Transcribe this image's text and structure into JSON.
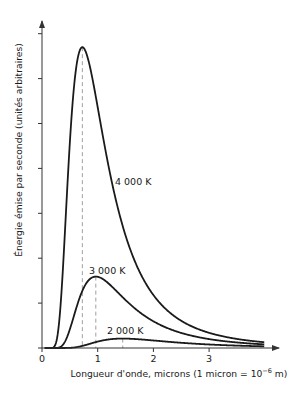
{
  "chart_data": {
    "type": "line",
    "title": "",
    "xlabel": "Longueur d'onde, microns (1 micron = 10",
    "xlabel_exp": "−6",
    "xlabel_end": " m)",
    "ylabel": "Énergie émise par seconde (unités arbitraires)",
    "xlim": [
      0,
      4.2
    ],
    "ylim": [
      0,
      7.3
    ],
    "x_ticks": [
      0,
      1,
      2,
      3
    ],
    "x_tick_labels": [
      "0",
      "1",
      "2",
      "3"
    ],
    "y_ticks": [
      1,
      2,
      3,
      4,
      5,
      6,
      7
    ],
    "y_tick_labels": [],
    "grid": false,
    "legend": "inline labels",
    "x_range_plotted": [
      0.05,
      3.99
    ],
    "series": [
      {
        "name": "4 000 K",
        "temperature_K": 4000,
        "peak_wavelength_micron": 0.72,
        "peak_value": 6.7,
        "label_pos": [
          115,
          185
        ]
      },
      {
        "name": "3 000 K",
        "temperature_K": 3000,
        "peak_wavelength_micron": 0.97,
        "peak_value": 1.59,
        "label_pos": [
          89,
          274
        ]
      },
      {
        "name": "2 000 K",
        "temperature_K": 2000,
        "peak_wavelength_micron": 1.45,
        "peak_value": 0.21,
        "label_pos": [
          107,
          334
        ]
      }
    ],
    "annotations": [
      "dashed vertical lines marking peak wavelength of each curve"
    ]
  },
  "colors": {
    "curve": "#1a1a1a",
    "axis": "#333333",
    "dashed": "#888888"
  }
}
